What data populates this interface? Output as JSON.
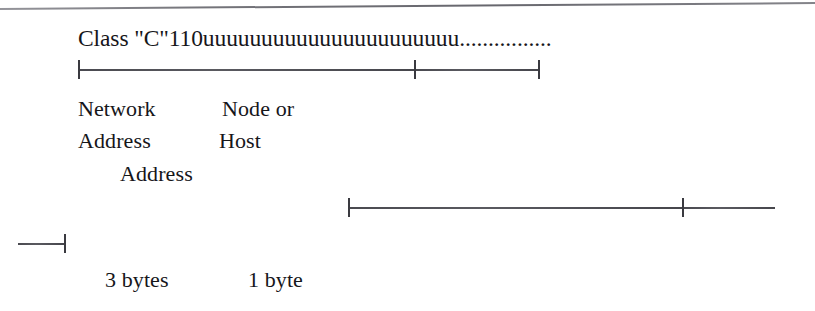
{
  "figure": {
    "background_color": "#ffffff",
    "ink_color": "#16161a",
    "rule_color": "#5f5f66"
  },
  "bit_pattern": {
    "label": "Class \"C\"110uuuuuuuuuuuuuuuuuuuuuu................",
    "class_prefix": "Class \"C\"",
    "leading_bits": "110",
    "variable_bits": "uuuuuuuuuuuuuuuuuuuuuu",
    "continuation": "................"
  },
  "labels": {
    "network": "Network",
    "node_or": "Node or",
    "address_1": "Address",
    "host": "Host",
    "address_2": "Address",
    "three_bytes": "3 bytes",
    "one_byte": "1 byte"
  },
  "rulers": {
    "network_host": {
      "name": "network-host-span",
      "start_x": 78,
      "mid_x": 414,
      "end_x": 538,
      "ticks": 3
    },
    "bytes": {
      "name": "bytes-span",
      "start_x": 348,
      "mid_x": 682,
      "end_x": 775,
      "ticks": 2
    },
    "stub": {
      "name": "stub-span",
      "start_x": 18,
      "end_x": 65,
      "ticks": 1
    }
  }
}
